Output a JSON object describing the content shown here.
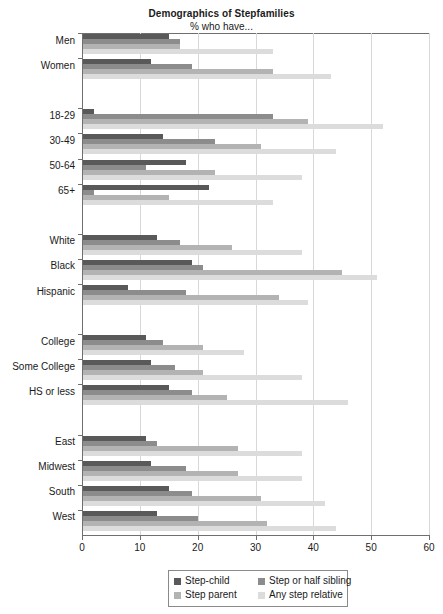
{
  "chart_data": {
    "type": "bar",
    "orientation": "horizontal",
    "title": "Demographics of Stepfamilies",
    "subtitle": "% who have...",
    "xlabel": "",
    "ylabel": "",
    "xlim": [
      0,
      60
    ],
    "xticks": [
      0,
      10,
      20,
      30,
      40,
      50,
      60
    ],
    "xtick_labels": [
      "0",
      "10",
      "20",
      "30",
      "40",
      "50",
      "60"
    ],
    "grid": true,
    "legend_position": "bottom",
    "series": [
      {
        "name": "Step-child",
        "color": "#595959"
      },
      {
        "name": "Step or half sibling",
        "color": "#8c8c8c"
      },
      {
        "name": "Step parent",
        "color": "#b3b3b3"
      },
      {
        "name": "Any step relative",
        "color": "#dcdcdc"
      }
    ],
    "legend_order": [
      "Step-child",
      "Step or half sibling",
      "Step parent",
      "Any step relative"
    ],
    "groups": [
      {
        "name": "gender",
        "categories": [
          "Men",
          "Women"
        ],
        "values": [
          {
            "category": "Men",
            "Step-child": 15,
            "Step or half sibling": 17,
            "Step parent": 17,
            "Any step relative": 33
          },
          {
            "category": "Women",
            "Step-child": 12,
            "Step or half sibling": 19,
            "Step parent": 33,
            "Any step relative": 43
          }
        ]
      },
      {
        "name": "age",
        "categories": [
          "18-29",
          "30-49",
          "50-64",
          "65+"
        ],
        "values": [
          {
            "category": "18-29",
            "Step-child": 2,
            "Step or half sibling": 33,
            "Step parent": 39,
            "Any step relative": 52
          },
          {
            "category": "30-49",
            "Step-child": 14,
            "Step or half sibling": 23,
            "Step parent": 31,
            "Any step relative": 44
          },
          {
            "category": "50-64",
            "Step-child": 18,
            "Step or half sibling": 11,
            "Step parent": 23,
            "Any step relative": 38
          },
          {
            "category": "65+",
            "Step-child": 22,
            "Step or half sibling": 2,
            "Step parent": 15,
            "Any step relative": 33
          }
        ]
      },
      {
        "name": "race",
        "categories": [
          "White",
          "Black",
          "Hispanic"
        ],
        "values": [
          {
            "category": "White",
            "Step-child": 13,
            "Step or half sibling": 17,
            "Step parent": 26,
            "Any step relative": 38
          },
          {
            "category": "Black",
            "Step-child": 19,
            "Step or half sibling": 21,
            "Step parent": 45,
            "Any step relative": 51
          },
          {
            "category": "Hispanic",
            "Step-child": 8,
            "Step or half sibling": 18,
            "Step parent": 34,
            "Any step relative": 39
          }
        ]
      },
      {
        "name": "education",
        "categories": [
          "College",
          "Some College",
          "HS or less"
        ],
        "values": [
          {
            "category": "College",
            "Step-child": 11,
            "Step or half sibling": 14,
            "Step parent": 21,
            "Any step relative": 28
          },
          {
            "category": "Some College",
            "Step-child": 12,
            "Step or half sibling": 16,
            "Step parent": 21,
            "Any step relative": 38
          },
          {
            "category": "HS or less",
            "Step-child": 15,
            "Step or half sibling": 19,
            "Step parent": 25,
            "Any step relative": 46
          }
        ]
      },
      {
        "name": "region",
        "categories": [
          "East",
          "Midwest",
          "South",
          "West"
        ],
        "values": [
          {
            "category": "East",
            "Step-child": 11,
            "Step or half sibling": 13,
            "Step parent": 27,
            "Any step relative": 38
          },
          {
            "category": "Midwest",
            "Step-child": 12,
            "Step or half sibling": 18,
            "Step parent": 27,
            "Any step relative": 38
          },
          {
            "category": "South",
            "Step-child": 15,
            "Step or half sibling": 19,
            "Step parent": 31,
            "Any step relative": 42
          },
          {
            "category": "West",
            "Step-child": 13,
            "Step or half sibling": 20,
            "Step parent": 32,
            "Any step relative": 44
          }
        ]
      }
    ]
  }
}
